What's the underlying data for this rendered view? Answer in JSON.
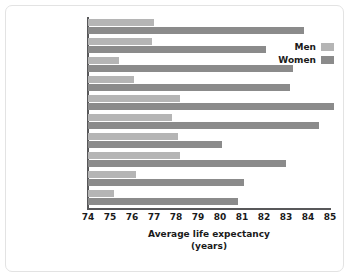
{
  "chart_data": {
    "type": "bar",
    "orientation": "horizontal",
    "title": "",
    "xlabel": "Average life expectancy",
    "xlabel_line2": "(years)",
    "ylabel": "",
    "xlim": [
      74,
      85
    ],
    "xticks": [
      74,
      75,
      76,
      77,
      78,
      79,
      80,
      81,
      82,
      83,
      84,
      85
    ],
    "grid": false,
    "legend_position": "top-right",
    "categories": [
      "Canada",
      "Greece",
      "Israel",
      "Italy",
      "Japan",
      "New Zealand",
      "South Korea",
      "Sweden",
      "United Kingdom",
      "United States"
    ],
    "series": [
      {
        "name": "Men",
        "color": "#b5b5b5",
        "values": [
          77.0,
          76.9,
          75.4,
          76.1,
          78.2,
          77.8,
          78.1,
          78.2,
          76.2,
          75.2
        ]
      },
      {
        "name": "Women",
        "color": "#8b8b8b",
        "values": [
          83.8,
          82.1,
          83.3,
          83.2,
          85.2,
          84.5,
          80.1,
          83.0,
          81.1,
          80.8
        ]
      }
    ]
  },
  "legend": {
    "items": [
      {
        "label": "Men",
        "color": "#b5b5b5"
      },
      {
        "label": "Women",
        "color": "#8b8b8b"
      }
    ]
  },
  "axis": {
    "x_title": "Average life expectancy",
    "x_title_line2": "(years)"
  }
}
